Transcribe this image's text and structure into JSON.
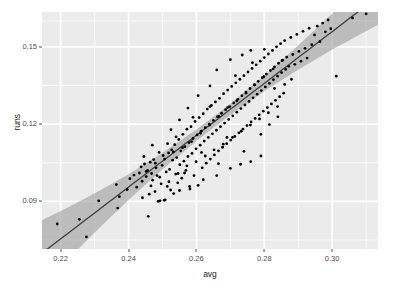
{
  "chart_data": {
    "type": "scatter",
    "title": "",
    "subtitle": "",
    "xlabel": "avg",
    "ylabel": "runs",
    "xlim": [
      0.2145,
      0.3135
    ],
    "ylim": [
      0.0715,
      0.1635
    ],
    "xticks": [
      0.22,
      0.24,
      0.26,
      0.28,
      0.3
    ],
    "xticklabels": [
      "0.22",
      "0.24",
      "0.26",
      "0.28",
      "0.30"
    ],
    "yticks": [
      0.09,
      0.12,
      0.15
    ],
    "yticklabels": [
      "0.09",
      "0.12",
      "0.15"
    ],
    "x_minor_ticks": [
      0.23,
      0.25,
      0.27,
      0.29,
      0.31
    ],
    "y_minor_ticks": [
      0.075,
      0.105,
      0.135,
      0.16
    ],
    "grid": true,
    "grid_color": "#ffffff",
    "panel_background": "#ebebeb",
    "legend": null,
    "legend_position": "none",
    "point_color": "#000000",
    "point_size": 1.9,
    "smooth": {
      "method": "lm",
      "line_color": "#3b3b3b",
      "band_color": "#9f9f9f",
      "band_opacity": 0.62,
      "fit_intercept": -0.14585,
      "fit_slope": 1.0058,
      "se_at_x": [
        [
          0.2145,
          0.0128
        ],
        [
          0.22,
          0.0108
        ],
        [
          0.23,
          0.0076
        ],
        [
          0.24,
          0.005
        ],
        [
          0.25,
          0.0032
        ],
        [
          0.26,
          0.00225
        ],
        [
          0.265,
          0.0021
        ],
        [
          0.27,
          0.00215
        ],
        [
          0.28,
          0.003
        ],
        [
          0.29,
          0.0047
        ],
        [
          0.3,
          0.007
        ],
        [
          0.31,
          0.00985
        ],
        [
          0.3135,
          0.01095
        ]
      ]
    },
    "points": [
      [
        0.219,
        0.0812
      ],
      [
        0.2255,
        0.083
      ],
      [
        0.2276,
        0.0762
      ],
      [
        0.2312,
        0.0902
      ],
      [
        0.2364,
        0.0965
      ],
      [
        0.2368,
        0.0874
      ],
      [
        0.2373,
        0.0918
      ],
      [
        0.2396,
        0.0946
      ],
      [
        0.2404,
        0.0988
      ],
      [
        0.2416,
        0.1002
      ],
      [
        0.2424,
        0.0955
      ],
      [
        0.2432,
        0.101
      ],
      [
        0.2437,
        0.1034
      ],
      [
        0.2441,
        0.0914
      ],
      [
        0.2447,
        0.1045
      ],
      [
        0.2452,
        0.0996
      ],
      [
        0.2456,
        0.102
      ],
      [
        0.2458,
        0.0842
      ],
      [
        0.2461,
        0.0928
      ],
      [
        0.2464,
        0.1052
      ],
      [
        0.2468,
        0.1008
      ],
      [
        0.2471,
        0.0982
      ],
      [
        0.2474,
        0.1062
      ],
      [
        0.2478,
        0.0938
      ],
      [
        0.2481,
        0.103
      ],
      [
        0.2484,
        0.1
      ],
      [
        0.2487,
        0.09
      ],
      [
        0.249,
        0.0901
      ],
      [
        0.2493,
        0.0902
      ],
      [
        0.2496,
        0.0968
      ],
      [
        0.2499,
        0.104
      ],
      [
        0.2502,
        0.1078
      ],
      [
        0.2505,
        0.0904
      ],
      [
        0.2508,
        0.0906
      ],
      [
        0.2511,
        0.1014
      ],
      [
        0.2514,
        0.0958
      ],
      [
        0.2518,
        0.1088
      ],
      [
        0.2521,
        0.1024
      ],
      [
        0.2524,
        0.0944
      ],
      [
        0.2527,
        0.11
      ],
      [
        0.253,
        0.106
      ],
      [
        0.2533,
        0.093
      ],
      [
        0.2536,
        0.112
      ],
      [
        0.2539,
        0.1006
      ],
      [
        0.2542,
        0.107
      ],
      [
        0.2545,
        0.0972
      ],
      [
        0.2548,
        0.114
      ],
      [
        0.2551,
        0.1042
      ],
      [
        0.2554,
        0.1096
      ],
      [
        0.2557,
        0.099
      ],
      [
        0.256,
        0.116
      ],
      [
        0.2563,
        0.1056
      ],
      [
        0.2566,
        0.1112
      ],
      [
        0.2569,
        0.102
      ],
      [
        0.2572,
        0.118
      ],
      [
        0.2575,
        0.1074
      ],
      [
        0.2578,
        0.1128
      ],
      [
        0.2581,
        0.0948
      ],
      [
        0.2584,
        0.119
      ],
      [
        0.2587,
        0.1086
      ],
      [
        0.259,
        0.1144
      ],
      [
        0.2593,
        0.1
      ],
      [
        0.2596,
        0.121
      ],
      [
        0.2599,
        0.1104
      ],
      [
        0.2602,
        0.1158
      ],
      [
        0.2605,
        0.0962
      ],
      [
        0.2608,
        0.1225
      ],
      [
        0.2611,
        0.1118
      ],
      [
        0.2614,
        0.1172
      ],
      [
        0.2617,
        0.103
      ],
      [
        0.262,
        0.124
      ],
      [
        0.2623,
        0.1134
      ],
      [
        0.2626,
        0.1186
      ],
      [
        0.2629,
        0.1048
      ],
      [
        0.2632,
        0.1258
      ],
      [
        0.2635,
        0.1148
      ],
      [
        0.2638,
        0.12
      ],
      [
        0.2641,
        0.1064
      ],
      [
        0.2644,
        0.1272
      ],
      [
        0.2647,
        0.1162
      ],
      [
        0.265,
        0.1214
      ],
      [
        0.2653,
        0.108
      ],
      [
        0.2656,
        0.1286
      ],
      [
        0.2659,
        0.1176
      ],
      [
        0.2662,
        0.1228
      ],
      [
        0.2665,
        0.1096
      ],
      [
        0.2668,
        0.13
      ],
      [
        0.2671,
        0.119
      ],
      [
        0.2674,
        0.1242
      ],
      [
        0.2677,
        0.111
      ],
      [
        0.268,
        0.1318
      ],
      [
        0.2683,
        0.1204
      ],
      [
        0.2686,
        0.1256
      ],
      [
        0.2689,
        0.1124
      ],
      [
        0.2692,
        0.1332
      ],
      [
        0.2695,
        0.1218
      ],
      [
        0.2698,
        0.1268
      ],
      [
        0.2701,
        0.1138
      ],
      [
        0.2704,
        0.1346
      ],
      [
        0.2707,
        0.1232
      ],
      [
        0.271,
        0.1282
      ],
      [
        0.2713,
        0.1152
      ],
      [
        0.2716,
        0.136
      ],
      [
        0.2719,
        0.1246
      ],
      [
        0.2722,
        0.1296
      ],
      [
        0.2725,
        0.1166
      ],
      [
        0.2728,
        0.1374
      ],
      [
        0.2731,
        0.126
      ],
      [
        0.2734,
        0.131
      ],
      [
        0.2737,
        0.118
      ],
      [
        0.274,
        0.1388
      ],
      [
        0.2743,
        0.1274
      ],
      [
        0.2746,
        0.1324
      ],
      [
        0.2749,
        0.1194
      ],
      [
        0.2752,
        0.1402
      ],
      [
        0.2755,
        0.1288
      ],
      [
        0.2758,
        0.1338
      ],
      [
        0.2761,
        0.1208
      ],
      [
        0.2764,
        0.1416
      ],
      [
        0.2767,
        0.1302
      ],
      [
        0.277,
        0.1352
      ],
      [
        0.2773,
        0.1222
      ],
      [
        0.2776,
        0.143
      ],
      [
        0.2779,
        0.1316
      ],
      [
        0.2782,
        0.1366
      ],
      [
        0.2785,
        0.1236
      ],
      [
        0.2788,
        0.1444
      ],
      [
        0.2791,
        0.133
      ],
      [
        0.2794,
        0.138
      ],
      [
        0.2797,
        0.125
      ],
      [
        0.28,
        0.1458
      ],
      [
        0.2803,
        0.1344
      ],
      [
        0.2806,
        0.1394
      ],
      [
        0.2809,
        0.1264
      ],
      [
        0.2812,
        0.1472
      ],
      [
        0.2815,
        0.1358
      ],
      [
        0.2818,
        0.1408
      ],
      [
        0.2821,
        0.1278
      ],
      [
        0.2824,
        0.1486
      ],
      [
        0.2827,
        0.1372
      ],
      [
        0.283,
        0.1422
      ],
      [
        0.2833,
        0.1292
      ],
      [
        0.2836,
        0.15
      ],
      [
        0.2839,
        0.1386
      ],
      [
        0.2842,
        0.1436
      ],
      [
        0.2845,
        0.1306
      ],
      [
        0.2848,
        0.1512
      ],
      [
        0.2851,
        0.14
      ],
      [
        0.2854,
        0.1448
      ],
      [
        0.2857,
        0.132
      ],
      [
        0.286,
        0.1524
      ],
      [
        0.2863,
        0.1412
      ],
      [
        0.2866,
        0.146
      ],
      [
        0.2872,
        0.1424
      ],
      [
        0.2878,
        0.1536
      ],
      [
        0.2884,
        0.147
      ],
      [
        0.289,
        0.1432
      ],
      [
        0.2896,
        0.1548
      ],
      [
        0.2902,
        0.1482
      ],
      [
        0.2908,
        0.1444
      ],
      [
        0.2914,
        0.156
      ],
      [
        0.292,
        0.1494
      ],
      [
        0.2926,
        0.1456
      ],
      [
        0.2932,
        0.1572
      ],
      [
        0.294,
        0.1508
      ],
      [
        0.2948,
        0.1546
      ],
      [
        0.2956,
        0.158
      ],
      [
        0.2964,
        0.152
      ],
      [
        0.2972,
        0.1592
      ],
      [
        0.298,
        0.1558
      ],
      [
        0.2988,
        0.1604
      ],
      [
        0.2996,
        0.157
      ],
      [
        0.3012,
        0.1386
      ],
      [
        0.306,
        0.1612
      ],
      [
        0.31,
        0.1628
      ],
      [
        0.244,
        0.0978
      ],
      [
        0.2452,
        0.1016
      ],
      [
        0.2466,
        0.096
      ],
      [
        0.2479,
        0.1048
      ],
      [
        0.2492,
        0.0994
      ],
      [
        0.2506,
        0.1064
      ],
      [
        0.2519,
        0.0976
      ],
      [
        0.2532,
        0.1092
      ],
      [
        0.2546,
        0.1008
      ],
      [
        0.2559,
        0.1108
      ],
      [
        0.2572,
        0.1038
      ],
      [
        0.2586,
        0.1132
      ],
      [
        0.2599,
        0.1054
      ],
      [
        0.2612,
        0.1164
      ],
      [
        0.2626,
        0.1076
      ],
      [
        0.2639,
        0.1196
      ],
      [
        0.2652,
        0.11
      ],
      [
        0.2666,
        0.123
      ],
      [
        0.2679,
        0.1122
      ],
      [
        0.2692,
        0.1264
      ],
      [
        0.2706,
        0.1148
      ],
      [
        0.2719,
        0.129
      ],
      [
        0.2732,
        0.1172
      ],
      [
        0.2746,
        0.132
      ],
      [
        0.2759,
        0.1196
      ],
      [
        0.2772,
        0.1352
      ],
      [
        0.2786,
        0.122
      ],
      [
        0.2799,
        0.1384
      ],
      [
        0.2812,
        0.1244
      ],
      [
        0.2826,
        0.1414
      ],
      [
        0.2839,
        0.1268
      ],
      [
        0.2852,
        0.1446
      ],
      [
        0.249,
        0.109
      ],
      [
        0.2515,
        0.1124
      ],
      [
        0.254,
        0.115
      ],
      [
        0.2565,
        0.101
      ],
      [
        0.259,
        0.1226
      ],
      [
        0.2615,
        0.109
      ],
      [
        0.264,
        0.1268
      ],
      [
        0.2665,
        0.1046
      ],
      [
        0.269,
        0.1148
      ],
      [
        0.2715,
        0.1388
      ],
      [
        0.274,
        0.1094
      ],
      [
        0.2765,
        0.1438
      ],
      [
        0.279,
        0.116
      ],
      [
        0.2815,
        0.1198
      ],
      [
        0.284,
        0.1228
      ],
      [
        0.266,
        0.141
      ],
      [
        0.27,
        0.145
      ],
      [
        0.2735,
        0.1468
      ],
      [
        0.276,
        0.1486
      ],
      [
        0.28,
        0.149
      ],
      [
        0.283,
        0.1338
      ],
      [
        0.286,
        0.1354
      ],
      [
        0.288,
        0.1374
      ],
      [
        0.264,
        0.1348
      ],
      [
        0.2605,
        0.131
      ],
      [
        0.2575,
        0.1262
      ],
      [
        0.255,
        0.1216
      ],
      [
        0.2525,
        0.1178
      ],
      [
        0.247,
        0.1118
      ],
      [
        0.2445,
        0.1074
      ],
      [
        0.276,
        0.1054
      ],
      [
        0.279,
        0.1076
      ],
      [
        0.266,
        0.1
      ],
      [
        0.262,
        0.0984
      ],
      [
        0.258,
        0.0958
      ],
      [
        0.255,
        0.0942
      ],
      [
        0.27,
        0.1028
      ],
      [
        0.273,
        0.1044
      ]
    ],
    "n_points": 270
  },
  "axes": {
    "x_title": "avg",
    "y_title": "runs"
  }
}
